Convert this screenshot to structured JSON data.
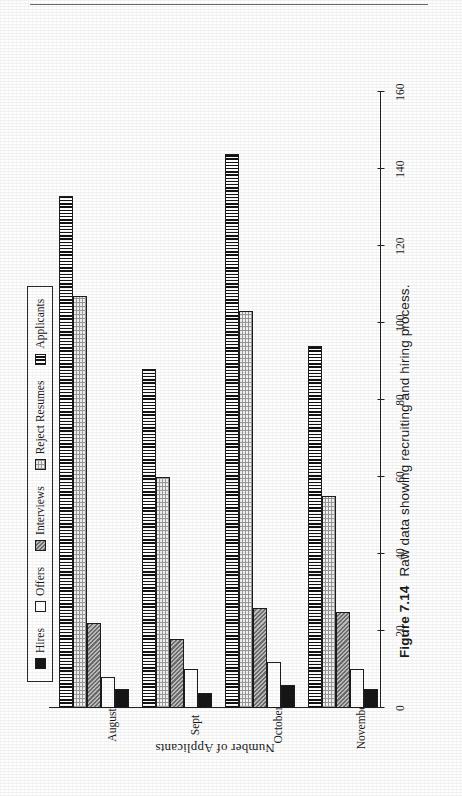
{
  "page": {
    "running_head": "7.4  MANAGING INNOVATION",
    "caption_number": "Figure 7.14",
    "caption_text": "Raw data showing recruiting and hiring process."
  },
  "legend": {
    "items": [
      {
        "label": "Hires",
        "swatch": "solid-black-swatch",
        "color": "#161616"
      },
      {
        "label": "Offers",
        "swatch": "white-swatch",
        "color": "#ffffff"
      },
      {
        "label": "Interviews",
        "swatch": "gray-checker-swatch",
        "color": "#9b9b9b"
      },
      {
        "label": "Reject Resumes",
        "swatch": "light-dotted-swatch",
        "color": "#f3f3f3"
      },
      {
        "label": "Applicants",
        "swatch": "vertical-stripe-swatch",
        "color": "#8d8d8d"
      }
    ]
  },
  "chart_data": {
    "type": "bar",
    "orientation": "vertical",
    "title": "",
    "xlabel": "",
    "ylabel": "Number of Applicants",
    "categories": [
      "August",
      "Sept",
      "October",
      "November"
    ],
    "ylim": [
      0,
      160
    ],
    "yticks": [
      0,
      20,
      40,
      60,
      80,
      100,
      120,
      140,
      160
    ],
    "yticklabels": [
      "0",
      "20",
      "40",
      "60",
      "80",
      "100",
      "120",
      "140",
      "160"
    ],
    "grid": false,
    "legend_position": "top",
    "series": [
      {
        "name": "Hires",
        "values": [
          5,
          4,
          6,
          5
        ]
      },
      {
        "name": "Offers",
        "values": [
          8,
          10,
          12,
          10
        ]
      },
      {
        "name": "Interviews",
        "values": [
          22,
          18,
          26,
          25
        ]
      },
      {
        "name": "Reject Resumes",
        "values": [
          107,
          60,
          103,
          55
        ]
      },
      {
        "name": "Applicants",
        "values": [
          133,
          88,
          144,
          94
        ]
      }
    ]
  }
}
